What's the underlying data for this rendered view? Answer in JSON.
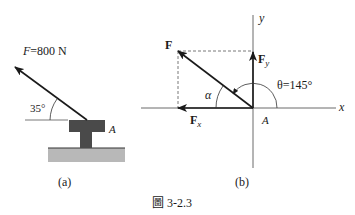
{
  "figure_a": {
    "force_label_var": "F",
    "force_label_eq": "=800 N",
    "angle_label": "35°",
    "point_label": "A",
    "caption": "(a)"
  },
  "figure_b": {
    "force_label": "F",
    "fy_label": "F",
    "fy_sub": "y",
    "fx_label": "F",
    "fx_sub": "x",
    "alpha_label": "α",
    "theta_label": "θ=145°",
    "x_axis_label": "x",
    "y_axis_label": "y",
    "origin_label": "A",
    "caption": "(b)"
  },
  "figure_caption": "圖 3-2.3",
  "colors": {
    "stroke": "#1a1a1a",
    "block": "#4a4a4a",
    "ground": "#b8b8b8",
    "dashed": "#555555"
  }
}
